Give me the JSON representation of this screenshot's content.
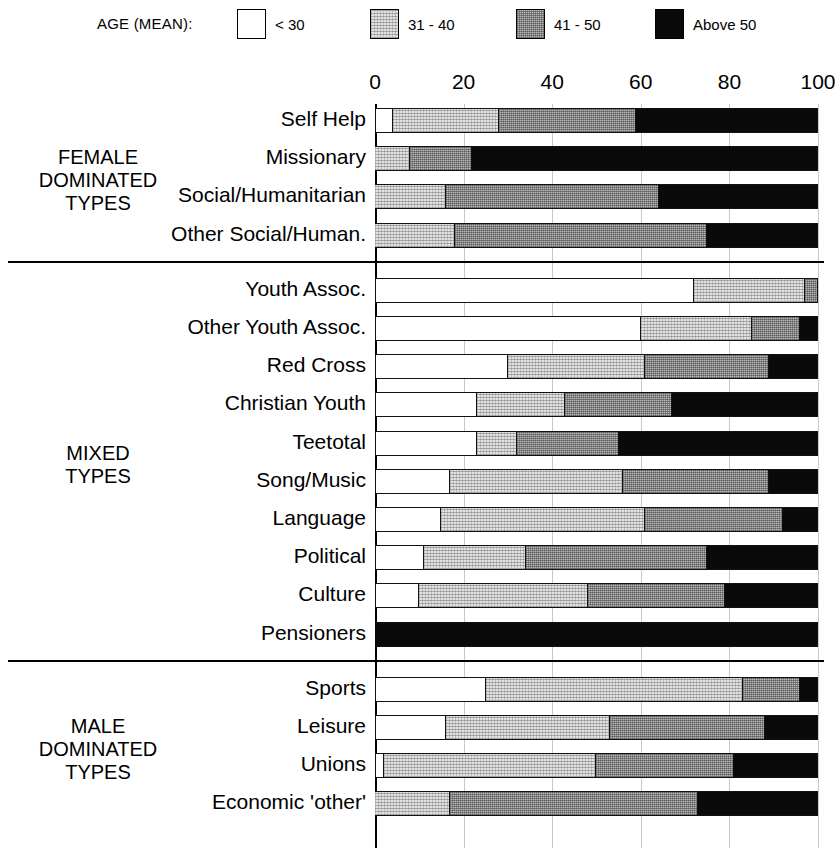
{
  "legend": {
    "title": "AGE (MEAN):",
    "items": [
      {
        "label": "< 30",
        "color": "#ffffff",
        "key": "lt30"
      },
      {
        "label": "31 - 40",
        "color": "#e2e2e2",
        "key": "31-40"
      },
      {
        "label": "41 - 50",
        "color": "#b9b9b9",
        "key": "41-50"
      },
      {
        "label": "Above 50",
        "color": "#0a0a0a",
        "key": "above50"
      }
    ]
  },
  "axis": {
    "ticks": [
      "0",
      "20",
      "40",
      "60",
      "80",
      "100"
    ],
    "min": 0,
    "max": 100
  },
  "groups": [
    {
      "title": "FEMALE\nDOMINATED\nTYPES"
    },
    {
      "title": "MIXED\nTYPES"
    },
    {
      "title": "MALE\nDOMINATED\nTYPES"
    }
  ],
  "rows": [
    {
      "label": "Self Help",
      "group": 0,
      "values": [
        4,
        24,
        31,
        41
      ]
    },
    {
      "label": "Missionary",
      "group": 0,
      "values": [
        0,
        8,
        14,
        78
      ]
    },
    {
      "label": "Social/Humanitarian",
      "group": 0,
      "values": [
        0,
        16,
        48,
        36
      ]
    },
    {
      "label": "Other Social/Human.",
      "group": 0,
      "values": [
        0,
        18,
        57,
        25
      ]
    },
    {
      "label": "Youth Assoc.",
      "group": 1,
      "values": [
        72,
        25,
        3,
        0
      ]
    },
    {
      "label": "Other Youth Assoc.",
      "group": 1,
      "values": [
        60,
        25,
        11,
        4
      ]
    },
    {
      "label": "Red Cross",
      "group": 1,
      "values": [
        30,
        31,
        28,
        11
      ]
    },
    {
      "label": "Christian Youth",
      "group": 1,
      "values": [
        23,
        20,
        24,
        33
      ]
    },
    {
      "label": "Teetotal",
      "group": 1,
      "values": [
        23,
        9,
        23,
        45
      ]
    },
    {
      "label": "Song/Music",
      "group": 1,
      "values": [
        17,
        39,
        33,
        11
      ]
    },
    {
      "label": "Language",
      "group": 1,
      "values": [
        15,
        46,
        31,
        8
      ]
    },
    {
      "label": "Political",
      "group": 1,
      "values": [
        11,
        23,
        41,
        25
      ]
    },
    {
      "label": "Culture",
      "group": 1,
      "values": [
        10,
        38,
        31,
        21
      ]
    },
    {
      "label": "Pensioners",
      "group": 1,
      "values": [
        0,
        0,
        0,
        100
      ]
    },
    {
      "label": "Sports",
      "group": 2,
      "values": [
        25,
        58,
        13,
        4
      ]
    },
    {
      "label": "Leisure",
      "group": 2,
      "values": [
        16,
        37,
        35,
        12
      ]
    },
    {
      "label": "Unions",
      "group": 2,
      "values": [
        2,
        48,
        31,
        19
      ]
    },
    {
      "label": "Economic 'other'",
      "group": 2,
      "values": [
        0,
        17,
        56,
        27
      ]
    }
  ],
  "chart_data": {
    "type": "bar",
    "orientation": "horizontal",
    "stacked": true,
    "normalized_percent": true,
    "title": "",
    "xlabel": "",
    "ylabel": "",
    "xlim": [
      0,
      100
    ],
    "grid": true,
    "legend_position": "top",
    "legend_title": "AGE (MEAN):",
    "xticks": [
      0,
      20,
      40,
      60,
      80,
      100
    ],
    "categories": [
      "Self Help",
      "Missionary",
      "Social/Humanitarian",
      "Other Social/Human.",
      "Youth Assoc.",
      "Other Youth Assoc.",
      "Red Cross",
      "Christian Youth",
      "Teetotal",
      "Song/Music",
      "Language",
      "Political",
      "Culture",
      "Pensioners",
      "Sports",
      "Leisure",
      "Unions",
      "Economic 'other'"
    ],
    "category_groups": [
      {
        "name": "FEMALE DOMINATED TYPES",
        "categories": [
          "Self Help",
          "Missionary",
          "Social/Humanitarian",
          "Other Social/Human."
        ]
      },
      {
        "name": "MIXED TYPES",
        "categories": [
          "Youth Assoc.",
          "Other Youth Assoc.",
          "Red Cross",
          "Christian Youth",
          "Teetotal",
          "Song/Music",
          "Language",
          "Political",
          "Culture",
          "Pensioners"
        ]
      },
      {
        "name": "MALE DOMINATED TYPES",
        "categories": [
          "Sports",
          "Leisure",
          "Unions",
          "Economic 'other'"
        ]
      }
    ],
    "series": [
      {
        "name": "< 30",
        "color": "#ffffff",
        "values": [
          4,
          0,
          0,
          0,
          72,
          60,
          30,
          23,
          23,
          17,
          15,
          11,
          10,
          0,
          25,
          16,
          2,
          0
        ]
      },
      {
        "name": "31 - 40",
        "color": "#e2e2e2",
        "values": [
          24,
          8,
          16,
          18,
          25,
          25,
          31,
          20,
          9,
          39,
          46,
          23,
          38,
          0,
          58,
          37,
          48,
          17
        ]
      },
      {
        "name": "41 - 50",
        "color": "#b9b9b9",
        "values": [
          31,
          14,
          48,
          57,
          3,
          11,
          28,
          24,
          23,
          33,
          31,
          41,
          31,
          0,
          13,
          35,
          31,
          56
        ]
      },
      {
        "name": "Above 50",
        "color": "#0a0a0a",
        "values": [
          41,
          78,
          36,
          25,
          0,
          4,
          11,
          33,
          45,
          11,
          8,
          25,
          21,
          100,
          4,
          12,
          19,
          27
        ]
      }
    ]
  }
}
